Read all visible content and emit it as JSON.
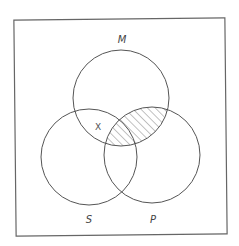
{
  "diagram": {
    "type": "venn-3-set",
    "colors": {
      "background": "#ffffff",
      "stroke": "#555555",
      "hatch": "#666666",
      "text": "#444444"
    },
    "frame": {
      "x": 15,
      "y": 19,
      "width": 211,
      "height": 216,
      "rotation_deg": -0.6
    },
    "sets": [
      {
        "id": "M",
        "label": "M",
        "cx": 121,
        "cy": 98,
        "r": 48,
        "label_x": 122,
        "label_y": 40
      },
      {
        "id": "S",
        "label": "S",
        "cx": 89,
        "cy": 157,
        "r": 48,
        "label_x": 89,
        "label_y": 220
      },
      {
        "id": "P",
        "label": "P",
        "cx": 152,
        "cy": 155,
        "r": 48,
        "label_x": 153,
        "label_y": 220
      }
    ],
    "shaded_regions": [
      {
        "description": "M ∩ P (entire intersection, including M ∩ S ∩ P)",
        "style": "diagonal-hatch"
      }
    ],
    "marks": [
      {
        "symbol": "X",
        "region": "M ∩ S, outside P",
        "x": 98,
        "y": 129
      }
    ]
  }
}
